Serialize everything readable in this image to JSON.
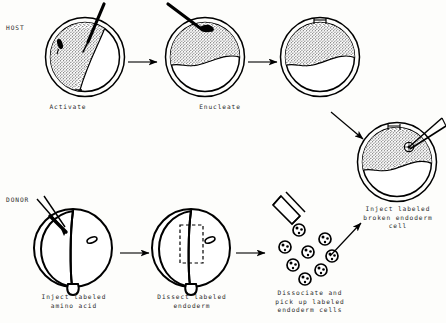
{
  "figure": {
    "type": "scientific-process-diagram",
    "background_color": "#fdfdfb",
    "ink_color": "#000000",
    "text_color": "#2a2a2a"
  },
  "row_labels": {
    "host": "HOST",
    "donor": "DONOR"
  },
  "host_row": {
    "steps": [
      {
        "id": "activate",
        "caption": "Activate",
        "cell": {
          "cx": 85,
          "cy": 57,
          "r_outer": 40,
          "r_inner": 35
        },
        "features": [
          "micropipette",
          "stippled-cytoplasm",
          "dark-nucleus-spot"
        ]
      },
      {
        "id": "enucleate",
        "caption": "Enucleate",
        "cell": {
          "cx": 205,
          "cy": 57,
          "r_outer": 40,
          "r_inner": 35
        },
        "features": [
          "micropipette",
          "stippled-upper-half",
          "nucleus-removal"
        ]
      },
      {
        "id": "enucleated-egg",
        "caption": "",
        "cell": {
          "cx": 320,
          "cy": 57,
          "r_outer": 40,
          "r_inner": 35
        },
        "features": [
          "stippled-upper-half",
          "membrane-pinch"
        ]
      },
      {
        "id": "inject-labeled-broken-endoderm-cell",
        "caption": "Inject labeled\nbroken endoderm\ncell",
        "cell": {
          "cx": 397,
          "cy": 162,
          "r_outer": 40,
          "r_inner": 35
        },
        "features": [
          "micropipette",
          "stippled-upper-half",
          "injected-labeled-cell"
        ]
      }
    ]
  },
  "donor_row": {
    "steps": [
      {
        "id": "inject-labeled-amino-acid",
        "caption": "Inject labeled\namino acid",
        "cell": {
          "cx": 73,
          "cy": 248,
          "r_outer": 40
        },
        "features": [
          "micropipette-pair",
          "embryo-outline",
          "blastopore",
          "small-oval"
        ]
      },
      {
        "id": "dissect-labeled-endoderm",
        "caption": "Dissect labeled\nendoderm",
        "cell": {
          "cx": 191,
          "cy": 248,
          "r_outer": 40
        },
        "features": [
          "embryo-outline",
          "dashed-dissection-box",
          "blastopore",
          "small-oval"
        ]
      },
      {
        "id": "dissociate-and-pick-up",
        "caption": "Dissociate and\npick up labeled\nendoderm cells",
        "features": [
          "wide-pipette",
          "dissociated-cells"
        ],
        "dissociated_cell_count": 8
      }
    ]
  },
  "arrows": [
    {
      "name": "host-arrow-1",
      "from": [
        128,
        62
      ],
      "to": [
        158,
        62
      ],
      "direction": "right"
    },
    {
      "name": "host-arrow-2",
      "from": [
        248,
        62
      ],
      "to": [
        278,
        62
      ],
      "direction": "right"
    },
    {
      "name": "host-arrow-down-right",
      "from": [
        331,
        113
      ],
      "to": [
        364,
        140
      ],
      "direction": "down-right"
    },
    {
      "name": "donor-arrow-1",
      "from": [
        120,
        253
      ],
      "to": [
        150,
        253
      ],
      "direction": "right"
    },
    {
      "name": "donor-arrow-2",
      "from": [
        236,
        253
      ],
      "to": [
        266,
        253
      ],
      "direction": "right"
    },
    {
      "name": "donor-arrow-up-right",
      "from": [
        330,
        255
      ],
      "to": [
        362,
        222
      ],
      "direction": "up-right"
    }
  ]
}
